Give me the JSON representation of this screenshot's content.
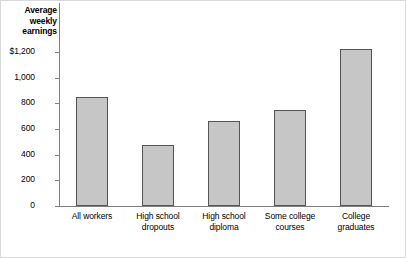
{
  "chart_data": {
    "type": "bar",
    "title": "",
    "xlabel": "",
    "ylabel": "Average weekly earnings",
    "ylabel_lines": [
      "Average",
      "weekly",
      "earnings"
    ],
    "categories": [
      "All workers",
      "High school dropouts",
      "High school diploma",
      "Some college courses",
      "College graduates"
    ],
    "category_lines": [
      [
        "All workers",
        ""
      ],
      [
        "High school",
        "dropouts"
      ],
      [
        "High school",
        "diploma"
      ],
      [
        "Some college",
        "courses"
      ],
      [
        "College",
        "graduates"
      ]
    ],
    "values": [
      850,
      475,
      660,
      750,
      1220
    ],
    "ylim": [
      0,
      1200
    ],
    "ytick_values": [
      0,
      200,
      400,
      600,
      800,
      1000,
      1200
    ],
    "ytick_labels": [
      "0",
      "200",
      "400",
      "600",
      "800",
      "1,000",
      "$1,200"
    ],
    "grid": false,
    "legend": null,
    "bar_fill_color": "#c6c6c6",
    "bar_border_color": "#555555",
    "axis_color": "#808080",
    "frame_color": "#d9d9d9",
    "background_color": "#ffffff"
  }
}
